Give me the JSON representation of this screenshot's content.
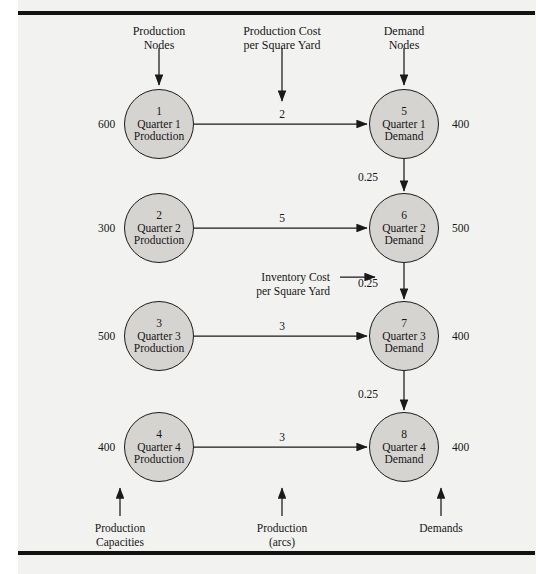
{
  "diagram": {
    "title_headers": [
      {
        "text": "Production\nNodes",
        "x": 159,
        "y": 24
      },
      {
        "text": "Production Cost\nper Square Yard",
        "x": 282,
        "y": 24
      },
      {
        "text": "Demand\nNodes",
        "x": 404,
        "y": 24
      }
    ],
    "footers": [
      {
        "text": "Production\nCapacities",
        "x": 120,
        "y": 522
      },
      {
        "text": "Production\n(arcs)",
        "x": 282,
        "y": 522
      },
      {
        "text": "Demands",
        "x": 441,
        "y": 522
      }
    ],
    "annotation": {
      "text": "Inventory Cost\nper Square Yard",
      "x": 330,
      "y": 271
    },
    "production_nodes": [
      {
        "id": "1",
        "line1": "Quarter 1",
        "line2": "Production",
        "supply": "600",
        "cx": 159,
        "cy": 124
      },
      {
        "id": "2",
        "line1": "Quarter 2",
        "line2": "Production",
        "supply": "300",
        "cx": 159,
        "cy": 228
      },
      {
        "id": "3",
        "line1": "Quarter 3",
        "line2": "Production",
        "supply": "500",
        "cx": 159,
        "cy": 336
      },
      {
        "id": "4",
        "line1": "Quarter 4",
        "line2": "Production",
        "supply": "400",
        "cx": 159,
        "cy": 447
      }
    ],
    "demand_nodes": [
      {
        "id": "5",
        "line1": "Quarter 1",
        "line2": "Demand",
        "demand": "400",
        "cx": 404,
        "cy": 124
      },
      {
        "id": "6",
        "line1": "Quarter 2",
        "line2": "Demand",
        "demand": "500",
        "cx": 404,
        "cy": 228
      },
      {
        "id": "7",
        "line1": "Quarter 3",
        "line2": "Demand",
        "demand": "400",
        "cx": 404,
        "cy": 336
      },
      {
        "id": "8",
        "line1": "Quarter 4",
        "line2": "Demand",
        "demand": "400",
        "cx": 404,
        "cy": 447
      }
    ],
    "production_arcs": [
      {
        "from": "1",
        "to": "5",
        "cost": "2",
        "x": 282,
        "y": 108
      },
      {
        "from": "2",
        "to": "6",
        "cost": "5",
        "x": 282,
        "y": 212
      },
      {
        "from": "3",
        "to": "7",
        "cost": "3",
        "x": 282,
        "y": 320
      },
      {
        "from": "4",
        "to": "8",
        "cost": "3",
        "x": 282,
        "y": 431
      }
    ],
    "inventory_arcs": [
      {
        "from": "5",
        "to": "6",
        "cost": "0.25",
        "x": 378,
        "y": 171
      },
      {
        "from": "6",
        "to": "7",
        "cost": "0.25",
        "x": 378,
        "y": 277
      },
      {
        "from": "7",
        "to": "8",
        "cost": "0.25",
        "x": 378,
        "y": 388
      }
    ],
    "colors": {
      "node_fill": "#d6d4d1",
      "node_stroke": "#1a1a1a",
      "page_bg": "#f2f2f0",
      "rule": "#15130f"
    }
  },
  "supply_labels": [
    {
      "value": "600",
      "x": 98,
      "y": 118
    },
    {
      "value": "300",
      "x": 98,
      "y": 222
    },
    {
      "value": "500",
      "x": 98,
      "y": 330
    },
    {
      "value": "400",
      "x": 98,
      "y": 441
    }
  ],
  "demand_labels": [
    {
      "value": "400",
      "x": 452,
      "y": 118
    },
    {
      "value": "500",
      "x": 452,
      "y": 222
    },
    {
      "value": "400",
      "x": 452,
      "y": 330
    },
    {
      "value": "400",
      "x": 452,
      "y": 441
    }
  ]
}
